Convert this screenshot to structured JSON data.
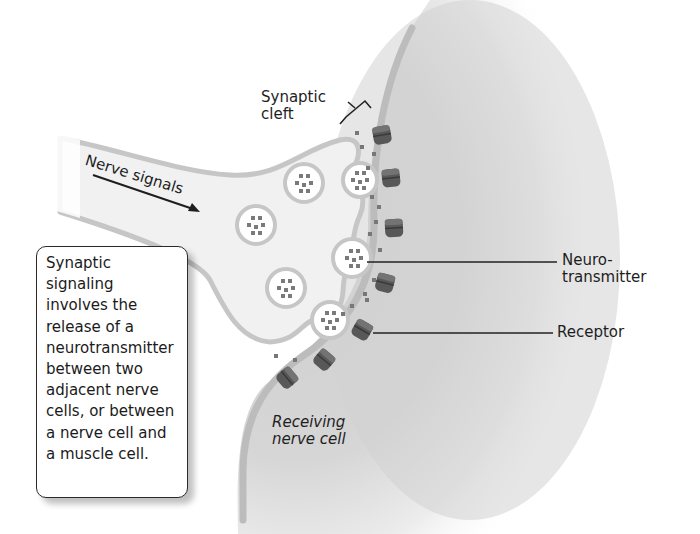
{
  "labels": {
    "synaptic_cleft_line1": "Synaptic",
    "synaptic_cleft_line2": "cleft",
    "nerve_signals": "Nerve signals",
    "neurotransmitter_line1": "Neuro-",
    "neurotransmitter_line2": "transmitter",
    "receptor": "Receptor",
    "receiving_line1": "Receiving",
    "receiving_line2": "nerve cell"
  },
  "callout": {
    "lines": [
      "Synaptic",
      "signaling",
      "involves the",
      "release of a",
      "neurotransmitter",
      "between two",
      "adjacent nerve",
      "cells, or between",
      "a nerve cell and",
      "a muscle cell."
    ]
  },
  "colors": {
    "membrane": "#c4c4c4",
    "cytoplasm": "#f1f1f1",
    "receiving_cell": "#d0d0d0",
    "receptor": "#5a5a5a",
    "neurotransmitter": "#777777",
    "leader_line": "#222222"
  },
  "icons": {
    "arrow": "arrow-right-down",
    "bracket": "bracket"
  }
}
